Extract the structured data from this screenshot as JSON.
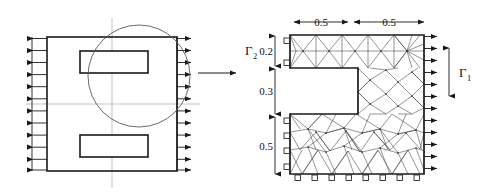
{
  "figure": {
    "background_color": "#ffffff",
    "line_color": "#1a1a1a",
    "mesh_color": "#3c3c3c",
    "centerline_color": "#9a9a9a",
    "circle_color": "#555555"
  },
  "left_panel": {
    "name": "full-plate-model",
    "outline": {
      "x": 47,
      "y": 37,
      "width": 130,
      "height": 134
    },
    "slots": [
      {
        "name": "upper-slot",
        "x": 80,
        "y": 51,
        "width": 68,
        "height": 22
      },
      {
        "name": "lower-slot",
        "x": 80,
        "y": 135,
        "width": 68,
        "height": 22
      }
    ],
    "left_load": {
      "arrow_count": 12,
      "direction": "left",
      "label": ""
    },
    "right_load": {
      "arrow_count": 12,
      "direction": "right",
      "label": ""
    },
    "centerlines": {
      "horizontal_y": 104,
      "vertical_x": 112
    },
    "detail_circle": {
      "cx": 139,
      "cy": 76,
      "r": 51
    }
  },
  "connector": {
    "name": "zoom-to-detail-arrow",
    "direction": "right",
    "label": ""
  },
  "right_panel": {
    "name": "quarter-model-mesh",
    "horizontal_dims": [
      {
        "label": "0.5",
        "span": "left"
      },
      {
        "label": "0.5",
        "span": "right"
      }
    ],
    "vertical_dims": [
      {
        "label": "0.2",
        "span": "top"
      },
      {
        "label": "0.3",
        "span": "middle"
      },
      {
        "label": "0.5",
        "span": "bottom"
      }
    ],
    "boundary_labels": [
      {
        "name": "gamma-2",
        "symbol": "Γ",
        "subscript": "2",
        "meaning": "symmetry-boundary",
        "side": "left"
      },
      {
        "name": "gamma-1",
        "symbol": "Γ",
        "subscript": "1",
        "meaning": "traction-boundary",
        "side": "right"
      }
    ],
    "traction_arrows": {
      "count": 12,
      "direction": "right",
      "edge": "right"
    },
    "supports": {
      "left_upper_count": 2,
      "left_lower_count": 4,
      "bottom_count": 8,
      "symbol": "roller-square"
    },
    "mesh": {
      "type": "unstructured-triangular",
      "domain_shape": "notched-C-shape"
    }
  }
}
